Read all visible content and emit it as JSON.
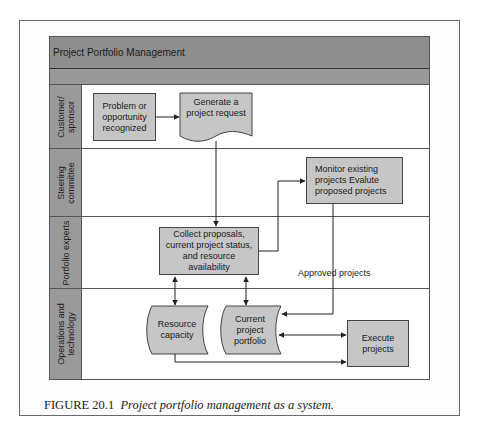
{
  "diagram": {
    "title": "Project Portfolio Management",
    "lanes": [
      {
        "label": "Customer/\nsponsor"
      },
      {
        "label": "Steering\ncommittee"
      },
      {
        "label": "Portfolio experts"
      },
      {
        "label": "Operations and\ntechnology"
      }
    ],
    "nodes": {
      "problem": "Problem or\nopportunity\nrecognized",
      "generate": "Generate a\nproject request",
      "monitor": "Monitor existing\nprojects Evalute\nproposed projects",
      "collect": "Collect proposals,\ncurrent project status,\nand resource\navailability",
      "resource": "Resource\ncapacity",
      "portfolio": "Current\nproject\nportfolio",
      "execute": "Execute\nprojects"
    },
    "edge_labels": {
      "approved": "Approved projects"
    },
    "colors": {
      "header": "#8e8e8e",
      "lane_label": "#9a9a9a",
      "box_fill": "#c6c6c6",
      "line": "#333333"
    }
  },
  "caption": {
    "number": "FIGURE 20.1",
    "text": "Project portfolio management as a system."
  }
}
